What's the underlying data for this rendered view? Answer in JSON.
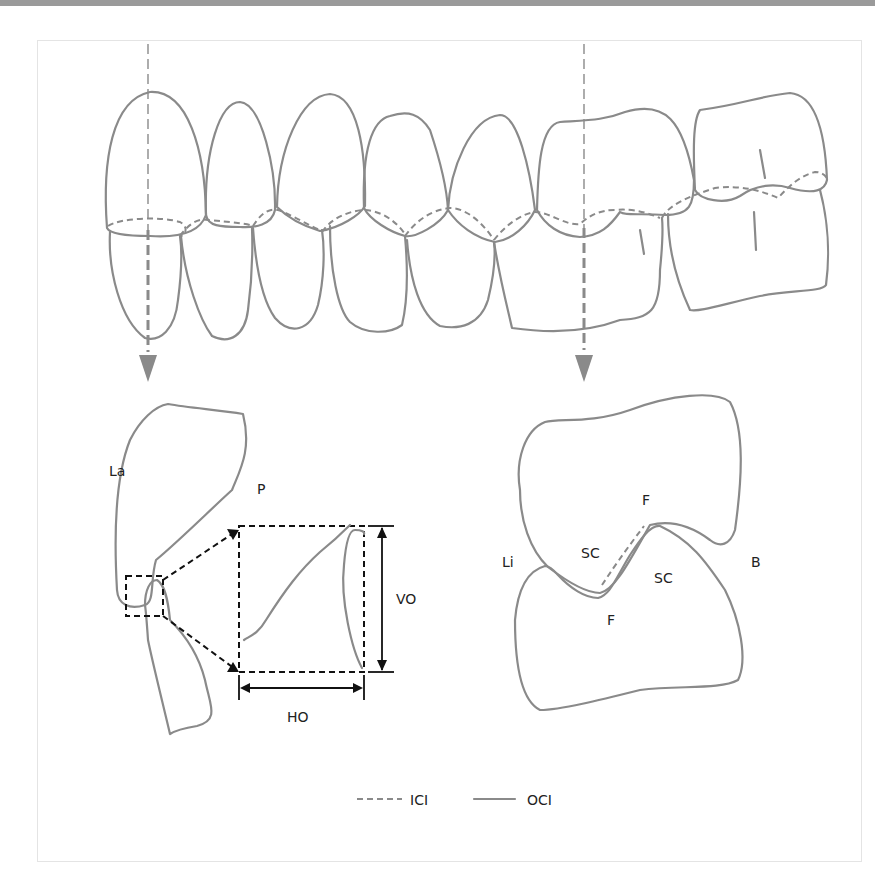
{
  "figure": {
    "labels": {
      "labial": "La",
      "palatal": "P",
      "vertical_overlap": "VO",
      "horizontal_overlap": "HO",
      "lingual": "Li",
      "buccal": "B",
      "fossa_upper": "F",
      "fossa_lower": "F",
      "supporting_cusp_left": "SC",
      "supporting_cusp_right": "SC"
    },
    "legend": [
      {
        "style": "dashed",
        "label": "ICI"
      },
      {
        "style": "solid",
        "label": "OCI"
      }
    ],
    "colors": {
      "outline": "#8a8a8a",
      "dimension": "#111111",
      "topbar": "#9a9a9a",
      "frame_border": "#e4e4e4"
    }
  }
}
